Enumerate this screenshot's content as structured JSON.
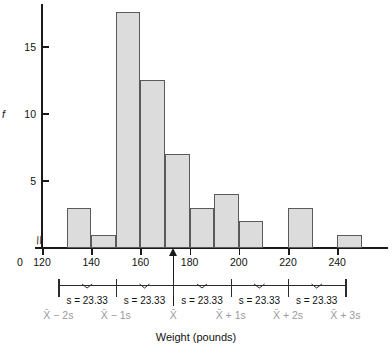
{
  "chart_data": {
    "type": "bar",
    "title": "",
    "xlabel": "Weight (pounds)",
    "ylabel": "f",
    "xlim": [
      120,
      250
    ],
    "ylim": [
      0,
      18
    ],
    "grid": false,
    "legend": null,
    "bin_width": 10,
    "categories": [
      "130-140",
      "140-150",
      "150-160",
      "160-170",
      "170-180",
      "180-190",
      "190-200",
      "200-210",
      "210-220",
      "220-230",
      "230-240",
      "240-250"
    ],
    "bin_starts": [
      130,
      140,
      150,
      160,
      170,
      180,
      190,
      200,
      210,
      220,
      230,
      240
    ],
    "values": [
      3,
      1,
      17.5,
      12.5,
      7,
      3,
      4,
      2,
      0,
      3,
      0,
      1
    ],
    "x_ticks": [
      0,
      120,
      140,
      160,
      180,
      200,
      220,
      240
    ],
    "x_tick_labels": [
      "0",
      "120",
      "140",
      "160",
      "180",
      "200",
      "220",
      "240"
    ],
    "y_ticks": [
      5,
      10,
      15
    ],
    "y_tick_labels": [
      "5",
      "10",
      "15"
    ],
    "axis_break": true,
    "axis_break_symbol": "//",
    "mean_marker": {
      "x": 173.33,
      "label": "mean-arrow"
    },
    "annotations": {
      "sd_value": "s = 23.33",
      "sd_numeric": 23.33,
      "segment_count": 5,
      "segment_labels": [
        "s = 23.33",
        "s = 23.33",
        "s = 23.33",
        "s = 23.33",
        "s = 23.33"
      ],
      "boundary_labels": [
        "X̄ − 2s",
        "X̄ − 1s",
        "X̄",
        "X̄ + 1s",
        "X̄ + 2s",
        "X̄ + 3s"
      ],
      "boundary_values": [
        126.67,
        150.0,
        173.33,
        196.67,
        220.0,
        243.33
      ]
    },
    "colors": {
      "bar_fill": "#dcdcdc",
      "bar_stroke": "#5a5a5a",
      "axis": "#1a1a1a",
      "annotation_text": "#111111",
      "boundary_label": "#9a9a9a"
    }
  },
  "axis": {
    "y_title": "f",
    "x_title": "Weight (pounds)"
  }
}
